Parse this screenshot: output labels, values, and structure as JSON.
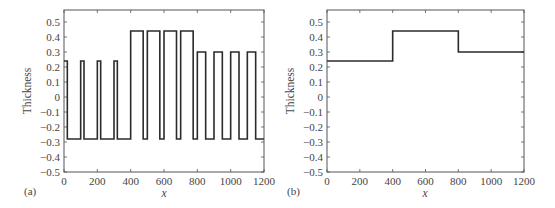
{
  "chart_data": [
    {
      "panel": "(a)",
      "type": "line",
      "style": "step",
      "title": "",
      "xlabel": "x",
      "ylabel": "Thickness",
      "xlim": [
        0,
        1200
      ],
      "ylim": [
        -0.5,
        0.58
      ],
      "xticks": [
        0,
        200,
        400,
        600,
        800,
        1000,
        1200
      ],
      "yticks": [
        -0.5,
        -0.4,
        -0.3,
        -0.2,
        -0.1,
        0,
        0.1,
        0.2,
        0.3,
        0.4,
        0.5
      ],
      "grid": false,
      "legend": null,
      "series": [
        {
          "name": "thickness",
          "x": [
            0,
            20,
            20,
            100,
            100,
            120,
            120,
            200,
            200,
            220,
            220,
            300,
            300,
            320,
            320,
            400,
            400,
            475,
            475,
            500,
            500,
            575,
            575,
            600,
            600,
            675,
            675,
            700,
            700,
            775,
            775,
            800,
            800,
            850,
            850,
            900,
            900,
            950,
            950,
            1000,
            1000,
            1050,
            1050,
            1100,
            1100,
            1150,
            1150,
            1200
          ],
          "y": [
            0.24,
            0.24,
            -0.28,
            -0.28,
            0.24,
            0.24,
            -0.28,
            -0.28,
            0.24,
            0.24,
            -0.28,
            -0.28,
            0.24,
            0.24,
            -0.28,
            -0.28,
            0.44,
            0.44,
            -0.28,
            -0.28,
            0.44,
            0.44,
            -0.28,
            -0.28,
            0.44,
            0.44,
            -0.28,
            -0.28,
            0.44,
            0.44,
            -0.28,
            -0.28,
            0.3,
            0.3,
            -0.28,
            -0.28,
            0.3,
            0.3,
            -0.28,
            -0.28,
            0.3,
            0.3,
            -0.28,
            -0.28,
            0.3,
            0.3,
            -0.28,
            -0.28
          ]
        }
      ]
    },
    {
      "panel": "(b)",
      "type": "line",
      "style": "step",
      "title": "",
      "xlabel": "x",
      "ylabel": "Thickness",
      "xlim": [
        0,
        1200
      ],
      "ylim": [
        -0.5,
        0.58
      ],
      "xticks": [
        0,
        200,
        400,
        600,
        800,
        1000,
        1200
      ],
      "yticks": [
        -0.5,
        -0.4,
        -0.3,
        -0.2,
        -0.1,
        0,
        0.1,
        0.2,
        0.3,
        0.4,
        0.5
      ],
      "grid": false,
      "legend": null,
      "series": [
        {
          "name": "thickness",
          "x": [
            0,
            400,
            400,
            800,
            800,
            1200
          ],
          "y": [
            0.24,
            0.24,
            0.44,
            0.44,
            0.3,
            0.3
          ]
        }
      ]
    }
  ],
  "panels": [
    {
      "label": "(a)",
      "xlabel": "x",
      "ylabel": "Thickness",
      "xtick_labels": [
        "0",
        "200",
        "400",
        "600",
        "800",
        "1000",
        "1200"
      ],
      "ytick_labels": [
        "0.5",
        "0.4",
        "0.3",
        "0.2",
        "0.1",
        "0",
        "−0.1",
        "−0.2",
        "−0.3",
        "−0.4",
        "−0.5"
      ]
    },
    {
      "label": "(b)",
      "xlabel": "x",
      "ylabel": "Thickness",
      "xtick_labels": [
        "0",
        "200",
        "400",
        "600",
        "800",
        "1000",
        "1200"
      ],
      "ytick_labels": [
        "0.5",
        "0.4",
        "0.3",
        "0.2",
        "0.1",
        "0",
        "−0.1",
        "−0.2",
        "−0.3",
        "−0.4",
        "−0.5"
      ]
    }
  ],
  "colors": {
    "line": "#2b2b2b",
    "axis": "#555555",
    "text": "#444444"
  }
}
